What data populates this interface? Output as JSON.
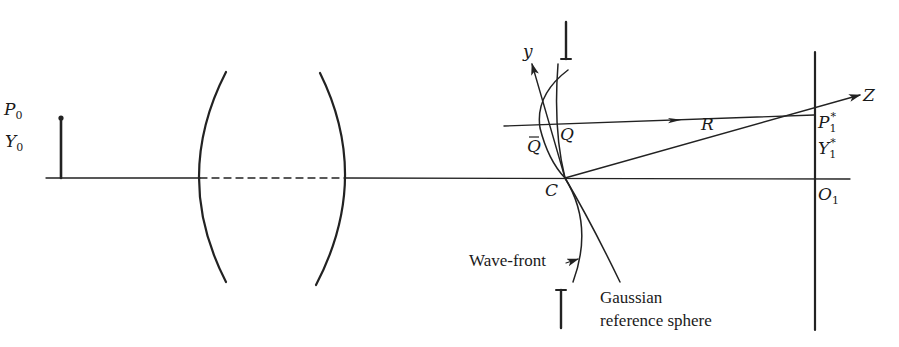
{
  "figure": {
    "type": "optical-system-diagram",
    "stroke_color": "#222222",
    "background": "#ffffff"
  },
  "labels": {
    "object_point": {
      "main": "P",
      "sub": "0"
    },
    "object_height": {
      "main": "Y",
      "sub": "0"
    },
    "y_axis": "y",
    "q_bar": "Q",
    "q": "Q",
    "center": "C",
    "radius": "R",
    "image_point": {
      "main": "P",
      "sub": "1",
      "sup": "*"
    },
    "image_height": {
      "main": "Y",
      "sub": "1",
      "sup": "*"
    },
    "image_origin": {
      "main": "O",
      "sub": "1"
    },
    "z_axis": "Z",
    "wave_front": "Wave-front",
    "reference_sphere_line1": "Gaussian",
    "reference_sphere_line2": "reference sphere"
  }
}
